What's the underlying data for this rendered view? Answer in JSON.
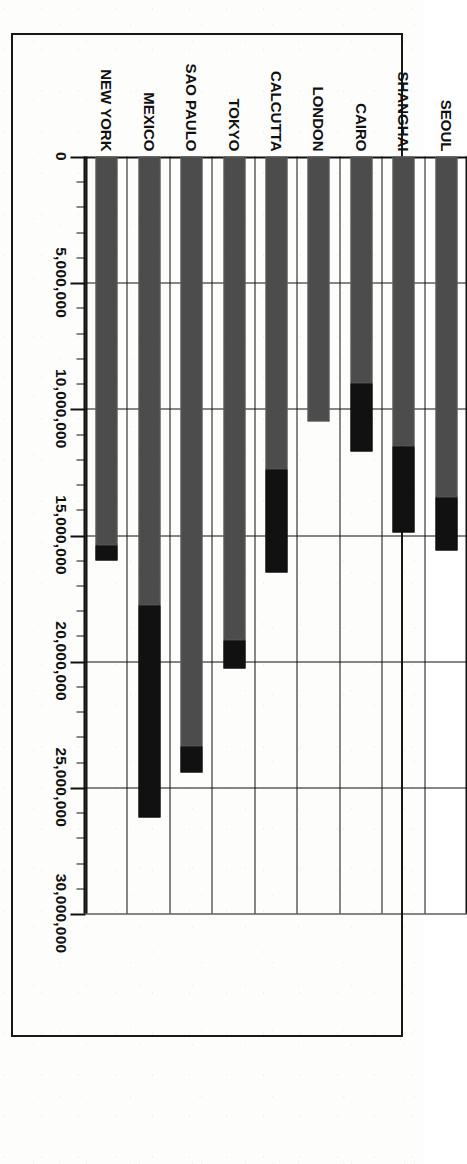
{
  "chart_data": {
    "type": "bar",
    "orientation": "vertical-bars-printed-sideways",
    "stacked": true,
    "title": "",
    "xlabel": "",
    "ylabel": "",
    "categories": [
      "SEOUL",
      "SHANGHAI",
      "CAIRO",
      "LONDON",
      "CALCUTTA",
      "TOKYO",
      "SAO PAULO",
      "MEXICO",
      "NEW YORK"
    ],
    "tick_labels": [
      "0",
      "5,000,000",
      "10,000,000",
      "15,000,000",
      "20,000,000",
      "25,000,000",
      "30,000,000"
    ],
    "tick_values": [
      0,
      5000000,
      10000000,
      15000000,
      20000000,
      25000000,
      30000000
    ],
    "ylim": [
      0,
      30000000
    ],
    "minor_ticks_per_interval": 5,
    "grid": true,
    "legend": "none",
    "series": [
      {
        "name": "lower-segment",
        "fill": "stipple",
        "values": [
          13500000,
          11500000,
          9000000,
          10500000,
          12400000,
          19200000,
          23400000,
          17800000,
          15400000
        ]
      },
      {
        "name": "upper-segment",
        "fill": "solid-black",
        "values": [
          2100000,
          3400000,
          2700000,
          0,
          4100000,
          1100000,
          1000000,
          8400000,
          600000
        ]
      }
    ],
    "totals": [
      15600000,
      14900000,
      11700000,
      10500000,
      16500000,
      20300000,
      24400000,
      26200000,
      16000000
    ],
    "bars": [
      {
        "category": "SEOUL",
        "lower": 13500000,
        "upper": 2100000,
        "total": 15600000
      },
      {
        "category": "SHANGHAI",
        "lower": 11500000,
        "upper": 3400000,
        "total": 14900000
      },
      {
        "category": "CAIRO",
        "lower": 9000000,
        "upper": 2700000,
        "total": 11700000
      },
      {
        "category": "LONDON",
        "lower": 10500000,
        "upper": 0,
        "total": 10500000
      },
      {
        "category": "CALCUTTA",
        "lower": 12400000,
        "upper": 4100000,
        "total": 16500000
      },
      {
        "category": "TOKYO",
        "lower": 19200000,
        "upper": 1100000,
        "total": 20300000
      },
      {
        "category": "SAO PAULO",
        "lower": 23400000,
        "upper": 1000000,
        "total": 24400000
      },
      {
        "category": "MEXICO",
        "lower": 17800000,
        "upper": 8400000,
        "total": 26200000
      },
      {
        "category": "NEW YORK",
        "lower": 15400000,
        "upper": 600000,
        "total": 16000000
      }
    ],
    "colors": {
      "ink": "#111111",
      "paper": "#fdfdfb",
      "segment_lower": "#ffffff",
      "segment_upper": "#111111"
    }
  }
}
